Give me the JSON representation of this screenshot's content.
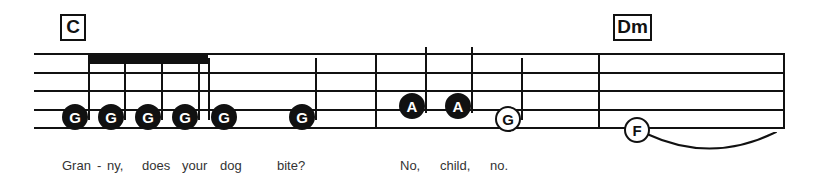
{
  "staff": {
    "line_count": 5,
    "left": 34,
    "right": 785,
    "top": 53,
    "bottom": 127,
    "line_spacing": 18.5,
    "color": "#111111"
  },
  "chords": [
    {
      "label": "C",
      "x": 60,
      "y": 14,
      "w": 26,
      "h": 27
    },
    {
      "label": "Dm",
      "x": 613,
      "y": 14,
      "w": 39,
      "h": 27
    }
  ],
  "barlines": [
    {
      "name": "barline-measure-1",
      "x": 375,
      "top": 53,
      "height": 75
    },
    {
      "name": "barline-measure-2",
      "x": 598,
      "top": 53,
      "height": 75
    },
    {
      "name": "barline-final",
      "x": 783,
      "top": 53,
      "height": 75
    }
  ],
  "beams": [
    {
      "name": "beam-group-1",
      "x": 88,
      "y": 55,
      "width": 120,
      "height": 9
    }
  ],
  "notes": [
    {
      "name": "note-g-1",
      "pitch": "G",
      "style": "filled",
      "x": 75,
      "y": 117,
      "lyric": "Gran"
    },
    {
      "name": "note-g-2",
      "pitch": "G",
      "style": "filled",
      "x": 111,
      "y": 117,
      "lyric": "-"
    },
    {
      "name": "note-g-3",
      "pitch": "G",
      "style": "filled",
      "x": 148,
      "y": 117,
      "lyric": "ny,"
    },
    {
      "name": "note-g-4",
      "pitch": "G",
      "style": "filled",
      "x": 185,
      "y": 117,
      "lyric": "does"
    },
    {
      "name": "note-g-5",
      "pitch": "G",
      "style": "filled",
      "x": 224,
      "y": 117,
      "lyric": "your"
    },
    {
      "name": "note-g-6",
      "pitch": "G",
      "style": "filled",
      "x": 302,
      "y": 117,
      "lyric": "dog"
    },
    {
      "name": "note-a-1",
      "pitch": "A",
      "style": "filled",
      "x": 412,
      "y": 106,
      "lyric": "No,"
    },
    {
      "name": "note-a-2",
      "pitch": "A",
      "style": "filled",
      "x": 458,
      "y": 106,
      "lyric": "child,"
    },
    {
      "name": "note-g-7",
      "pitch": "G",
      "style": "open",
      "x": 508,
      "y": 119,
      "lyric": "no."
    },
    {
      "name": "note-f-1",
      "pitch": "F",
      "style": "open",
      "x": 637,
      "y": 130,
      "lyric": ""
    }
  ],
  "stems": [
    {
      "name": "stem-g-1",
      "x": 88,
      "top": 58,
      "height": 62
    },
    {
      "name": "stem-g-2",
      "x": 124,
      "top": 58,
      "height": 62
    },
    {
      "name": "stem-g-3",
      "x": 161,
      "top": 58,
      "height": 62
    },
    {
      "name": "stem-g-4",
      "x": 198,
      "top": 58,
      "height": 62
    },
    {
      "name": "stem-g-5",
      "x": 208,
      "top": 58,
      "height": 62
    },
    {
      "name": "stem-g-6",
      "x": 315,
      "top": 58,
      "height": 62
    },
    {
      "name": "stem-a-1",
      "x": 425,
      "top": 47,
      "height": 66
    },
    {
      "name": "stem-a-2",
      "x": 471,
      "top": 47,
      "height": 66
    },
    {
      "name": "stem-g-7",
      "x": 521,
      "top": 58,
      "height": 62
    }
  ],
  "slur": {
    "name": "slur-tie",
    "start_x": 645,
    "end_x": 778,
    "y": 132,
    "depth": 18
  },
  "lyrics": [
    {
      "text": "Gran",
      "x": 62,
      "y": 159
    },
    {
      "text": "-",
      "x": 97,
      "y": 159
    },
    {
      "text": "ny,",
      "x": 107,
      "y": 159
    },
    {
      "text": "does",
      "x": 142,
      "y": 159
    },
    {
      "text": "your",
      "x": 182,
      "y": 159
    },
    {
      "text": "dog",
      "x": 220,
      "y": 159
    },
    {
      "text": "bite?",
      "x": 277,
      "y": 159
    },
    {
      "text": "No,",
      "x": 400,
      "y": 159
    },
    {
      "text": "child,",
      "x": 440,
      "y": 159
    },
    {
      "text": "no.",
      "x": 490,
      "y": 159
    }
  ],
  "colors": {
    "ink": "#111111",
    "lyric_text": "#333333",
    "paper": "#ffffff"
  }
}
